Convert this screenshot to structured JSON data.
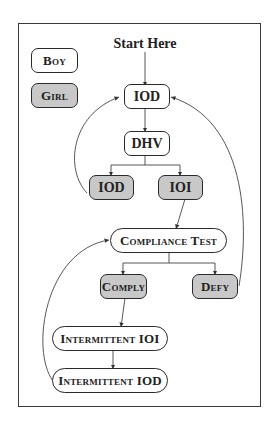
{
  "diagram": {
    "start_label": "Start Here",
    "legend": [
      {
        "label": "Boy",
        "fill": "#ffffff",
        "meaning": "boy"
      },
      {
        "label": "Girl",
        "fill": "#c8c8c8",
        "meaning": "girl"
      }
    ],
    "nodes": [
      {
        "id": "iod_top",
        "label": "IOD",
        "actor": "boy"
      },
      {
        "id": "dhv",
        "label": "DHV",
        "actor": "boy"
      },
      {
        "id": "iod_mid",
        "label": "IOD",
        "actor": "girl"
      },
      {
        "id": "ioi_mid",
        "label": "IOI",
        "actor": "girl"
      },
      {
        "id": "compliance_test",
        "label": "Compliance Test",
        "actor": "boy"
      },
      {
        "id": "comply",
        "label": "Comply",
        "actor": "girl"
      },
      {
        "id": "defy",
        "label": "Defy",
        "actor": "girl"
      },
      {
        "id": "intermittent_ioi",
        "label": "Intermittent IOI",
        "actor": "boy"
      },
      {
        "id": "intermittent_iod",
        "label": "Intermittent IOD",
        "actor": "boy"
      }
    ],
    "edges": [
      {
        "from": "start",
        "to": "iod_top"
      },
      {
        "from": "iod_top",
        "to": "dhv"
      },
      {
        "from": "dhv",
        "to": "iod_mid"
      },
      {
        "from": "dhv",
        "to": "ioi_mid"
      },
      {
        "from": "iod_mid",
        "to": "iod_top"
      },
      {
        "from": "ioi_mid",
        "to": "compliance_test"
      },
      {
        "from": "compliance_test",
        "to": "comply"
      },
      {
        "from": "compliance_test",
        "to": "defy"
      },
      {
        "from": "defy",
        "to": "iod_top"
      },
      {
        "from": "comply",
        "to": "intermittent_ioi"
      },
      {
        "from": "intermittent_ioi",
        "to": "intermittent_iod"
      },
      {
        "from": "intermittent_iod",
        "to": "compliance_test"
      }
    ],
    "colors": {
      "boy_fill": "#ffffff",
      "girl_fill": "#c8c8c8",
      "stroke": "#2a2a2a"
    }
  }
}
